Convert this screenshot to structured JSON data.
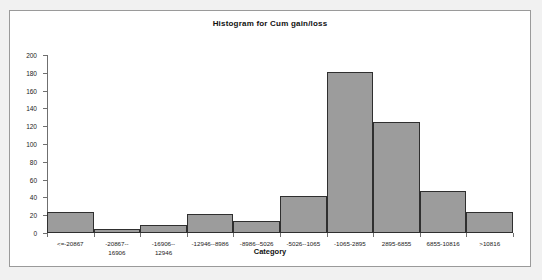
{
  "chart_data": {
    "type": "bar",
    "title": "Histogram for Cum gain/loss",
    "subtitle": "",
    "xlabel": "Category",
    "ylabel": "",
    "ylim": [
      0,
      200
    ],
    "ytick_step": 20,
    "yticks": [
      "0",
      "20",
      "40",
      "60",
      "80",
      "100",
      "120",
      "140",
      "160",
      "180",
      "200"
    ],
    "grid": false,
    "legend": "none",
    "categories": [
      "<=-20867",
      "-20867--16906",
      "-16906--12946",
      "-12946--8986",
      "-8986--5026",
      "-5026--1065",
      "-1065-2895",
      "2895-6855",
      "6855-10816",
      ">10816"
    ],
    "category_lines": [
      [
        "<=-20867"
      ],
      [
        "-20867--",
        "16906"
      ],
      [
        "-16906--",
        "12946"
      ],
      [
        "-12946--8986"
      ],
      [
        "-8986--5026"
      ],
      [
        "-5026--1065"
      ],
      [
        "-1065-2895"
      ],
      [
        "2895-6855"
      ],
      [
        "6855-10816"
      ],
      [
        ">10816"
      ]
    ],
    "values": [
      24,
      5,
      9,
      21,
      13,
      42,
      181,
      125,
      47,
      24
    ],
    "bar_color": "#9c9c9c",
    "bar_border_color": "#2f2f2f",
    "axis_color": "#6f6f6f",
    "plot_background": "#ffffff",
    "page_background": "#f1f1f1",
    "frame_border_color": "#9a9a9a"
  }
}
